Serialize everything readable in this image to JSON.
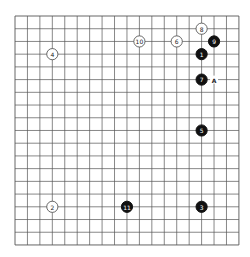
{
  "board": {
    "size": 19,
    "origin_x": 15,
    "origin_y": 16,
    "step_x": 12.44,
    "step_y": 12.72,
    "line_color": "#555555",
    "stone_radius": 5.6
  },
  "stones": [
    {
      "move": "1",
      "color": "black",
      "col": 15,
      "row": 3
    },
    {
      "move": "2",
      "color": "white",
      "col": 3,
      "row": 15
    },
    {
      "move": "3",
      "color": "black",
      "col": 15,
      "row": 15
    },
    {
      "move": "4",
      "color": "white",
      "col": 3,
      "row": 3
    },
    {
      "move": "5",
      "color": "black",
      "col": 15,
      "row": 9
    },
    {
      "move": "6",
      "color": "white",
      "col": 13,
      "row": 2
    },
    {
      "move": "7",
      "color": "black",
      "col": 15,
      "row": 5
    },
    {
      "move": "8",
      "color": "white",
      "col": 15,
      "row": 1
    },
    {
      "move": "9",
      "color": "black",
      "col": 16,
      "row": 2
    },
    {
      "move": "10",
      "color": "white",
      "col": 10,
      "row": 2
    },
    {
      "move": "11",
      "color": "black",
      "col": 9,
      "row": 15
    }
  ],
  "markers": [
    {
      "label": "A",
      "col": 16,
      "row": 5
    }
  ]
}
